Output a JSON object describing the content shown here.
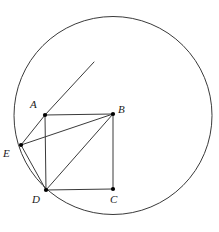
{
  "figure": {
    "canvas": {
      "width": 219,
      "height": 232
    },
    "stroke_color": "#3a3a3a",
    "point_color": "#000000",
    "label_color": "#1a1a1a",
    "background_color": "#ffffff"
  },
  "circle": {
    "name": "circumscribing-circle",
    "cx": 113,
    "cy": 115.5,
    "r": 99,
    "stroke_width": 1
  },
  "points": [
    {
      "id": "A",
      "label": "A",
      "x": 45,
      "y": 115,
      "label_x": 30,
      "label_y": 99
    },
    {
      "id": "B",
      "label": "B",
      "x": 113,
      "y": 114,
      "label_x": 118,
      "label_y": 104
    },
    {
      "id": "C",
      "label": "C",
      "x": 113,
      "y": 189,
      "label_x": 110,
      "label_y": 194
    },
    {
      "id": "D",
      "label": "D",
      "x": 46,
      "y": 190,
      "label_x": 32,
      "label_y": 194
    },
    {
      "id": "E",
      "label": "E",
      "x": 21,
      "y": 145,
      "label_x": 3,
      "label_y": 148
    }
  ],
  "segments": [
    {
      "name": "segment-AB",
      "x1": 45,
      "y1": 115,
      "x2": 113,
      "y2": 114
    },
    {
      "name": "segment-BC",
      "x1": 113,
      "y1": 114,
      "x2": 113,
      "y2": 189
    },
    {
      "name": "segment-CD",
      "x1": 113,
      "y1": 189,
      "x2": 46,
      "y2": 190
    },
    {
      "name": "segment-DA",
      "x1": 46,
      "y1": 190,
      "x2": 45,
      "y2": 115
    },
    {
      "name": "segment-DB",
      "x1": 46,
      "y1": 190,
      "x2": 113,
      "y2": 114
    },
    {
      "name": "segment-EA",
      "x1": 21,
      "y1": 145,
      "x2": 45,
      "y2": 115
    },
    {
      "name": "segment-EB",
      "x1": 21,
      "y1": 145,
      "x2": 113,
      "y2": 114
    },
    {
      "name": "segment-ED",
      "x1": 21,
      "y1": 145,
      "x2": 46,
      "y2": 190
    }
  ],
  "ray": {
    "name": "ray-EA-extended",
    "x1": 45,
    "y1": 115,
    "x2": 94,
    "y2": 62
  },
  "point_radius": 2.1
}
